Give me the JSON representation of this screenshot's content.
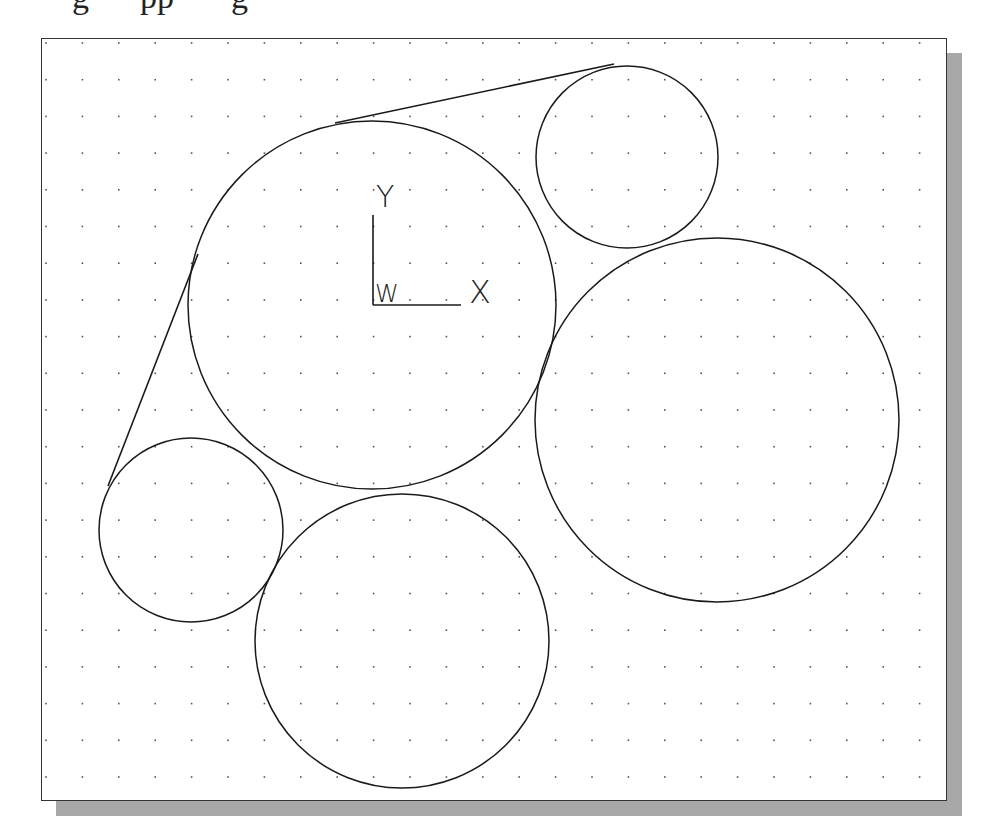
{
  "caption": {
    "fragments": [
      {
        "text": "g",
        "x": 72
      },
      {
        "text": "pp",
        "x": 140
      },
      {
        "text": "g",
        "x": 231
      }
    ]
  },
  "frame": {
    "x": 41,
    "y": 38,
    "width": 906,
    "height": 763,
    "border_color": "#333333",
    "background": "#ffffff"
  },
  "shadow": {
    "offset": 15,
    "color": "#a8a8a8"
  },
  "grid": {
    "origin_x": 46,
    "origin_y": 43,
    "spacing_x": 36.4,
    "spacing_y": 36.7,
    "cols": 25,
    "rows": 21,
    "dot_color": "#555555",
    "dot_size": 1.6
  },
  "circles": [
    {
      "name": "large-center-circle",
      "cx": 372,
      "cy": 305,
      "r": 184
    },
    {
      "name": "small-top-right-circle",
      "cx": 627,
      "cy": 157,
      "r": 91
    },
    {
      "name": "large-right-circle",
      "cx": 717,
      "cy": 420,
      "r": 182
    },
    {
      "name": "small-left-circle",
      "cx": 191,
      "cy": 530,
      "r": 92
    },
    {
      "name": "bottom-circle",
      "cx": 402,
      "cy": 641,
      "r": 147
    }
  ],
  "lines": [
    {
      "name": "top-tangent-line",
      "x1": 335,
      "y1": 123,
      "x2": 614,
      "y2": 64
    },
    {
      "name": "left-tangent-line",
      "x1": 198,
      "y1": 254,
      "x2": 108,
      "y2": 486
    }
  ],
  "stroke_color": "#1a1a1a",
  "ucs_icon": {
    "origin_x": 373,
    "origin_y": 305,
    "y_axis_length": 90,
    "x_axis_length": 88,
    "y_label": "Y",
    "x_label": "X",
    "w_label": "W"
  }
}
